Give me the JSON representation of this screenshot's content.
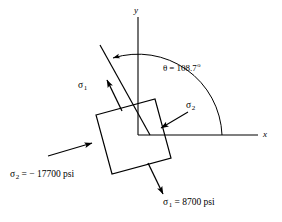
{
  "figure": {
    "type": "stress-element-diagram",
    "background_color": "#ffffff",
    "stroke_color": "#000000",
    "axes": {
      "x_label": "x",
      "y_label": "y",
      "origin": [
        138,
        135
      ]
    },
    "angle": {
      "symbol": "θ",
      "equals": "=",
      "value": "108.7",
      "unit": "o",
      "full_text": "θ = 108.7",
      "degree_mark": "o"
    },
    "element": {
      "shape": "rotated-square",
      "rotation_deg": -15,
      "corners": [
        [
          96,
          115
        ],
        [
          155,
          99
        ],
        [
          171,
          158
        ],
        [
          112,
          174
        ]
      ]
    },
    "stresses": [
      {
        "name": "sigma-1-upper",
        "symbol": "σ",
        "subscript": "1",
        "label": "σ",
        "direction": "up-left"
      },
      {
        "name": "sigma-2-inner",
        "symbol": "σ",
        "subscript": "2",
        "label": "σ",
        "direction": "left-down"
      }
    ],
    "callouts": {
      "sigma2_value": {
        "symbol": "σ",
        "subscript": "2",
        "rest": " = − 17700 psi",
        "numeric": -17700,
        "unit": "psi"
      },
      "sigma1_value": {
        "symbol": "σ",
        "subscript": "1",
        "rest": " = 8700 psi",
        "numeric": 8700,
        "unit": "psi"
      }
    }
  }
}
